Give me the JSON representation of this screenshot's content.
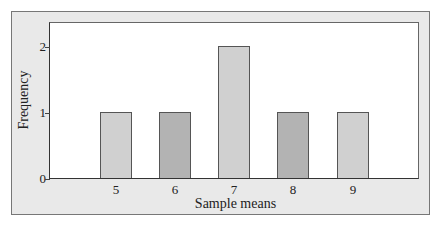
{
  "chart_data": {
    "type": "bar",
    "title": "",
    "xlabel": "Sample means",
    "ylabel": "Frequency",
    "categories": [
      "5",
      "6",
      "7",
      "8",
      "9"
    ],
    "values": [
      1,
      1,
      2,
      1,
      1
    ],
    "ylim": [
      0,
      2.35
    ],
    "yticks": [
      "0",
      "1",
      "2"
    ],
    "grid": false,
    "bar_colors": [
      "#d0d0d0",
      "#b3b3b3",
      "#d0d0d0",
      "#b3b3b3",
      "#d0d0d0"
    ]
  },
  "labels": {
    "x_title": "Sample means",
    "y_title": "Frequency",
    "y_ticks": [
      "0",
      "1",
      "2"
    ],
    "x_ticks": [
      "5",
      "6",
      "7",
      "8",
      "9"
    ]
  }
}
